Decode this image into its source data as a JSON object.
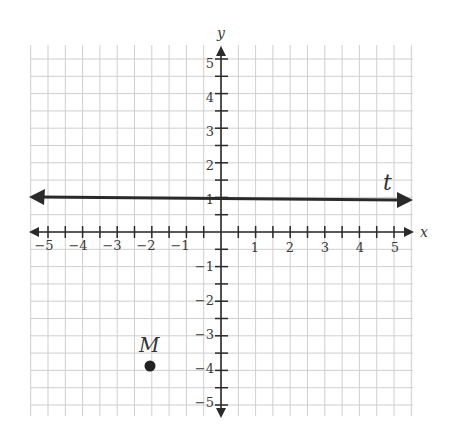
{
  "figure": {
    "x_axis_label": "x",
    "y_axis_label": "y",
    "x_ticks": [
      -5,
      -4,
      -3,
      -2,
      -1,
      1,
      2,
      3,
      4,
      5
    ],
    "y_ticks": [
      5,
      4,
      3,
      2,
      1,
      -1,
      -2,
      -3,
      -4,
      -5
    ],
    "x_tick_labels": [
      "−5",
      "−4",
      "−3",
      "−2",
      "−1",
      "1",
      "2",
      "3",
      "4",
      "5"
    ],
    "y_tick_labels": [
      "5",
      "4",
      "3",
      "2",
      "1",
      "−1",
      "−2",
      "−3",
      "−4",
      "−5"
    ],
    "grid_spacing": 0.5,
    "line": {
      "label": "t",
      "equation": "y = 1"
    },
    "point": {
      "label": "M",
      "x": -2,
      "y": -4
    }
  },
  "chart_data": {
    "type": "scatter",
    "title": "",
    "xlabel": "x",
    "ylabel": "y",
    "xlim": [
      -5.5,
      5.5
    ],
    "ylim": [
      -5.5,
      5.5
    ],
    "grid": true,
    "grid_minor_step": 0.5,
    "series": [
      {
        "name": "M",
        "x": [
          -2
        ],
        "y": [
          -4
        ],
        "marker": "filled-circle"
      },
      {
        "name": "t",
        "kind": "horizontal-line",
        "y": 1,
        "arrows": "both"
      }
    ],
    "annotations": [
      {
        "text": "t",
        "x": 4.7,
        "y": 1.3
      },
      {
        "text": "M",
        "x": -2.2,
        "y": -3.5
      }
    ]
  },
  "colors": {
    "grid": "#cfcfcf",
    "axis": "#2b2b2b",
    "line": "#2a2a2a",
    "point": "#222222"
  }
}
